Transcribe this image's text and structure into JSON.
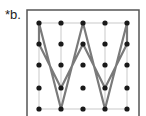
{
  "label": "*b.",
  "grid": {
    "cols_x": [
      39,
      61,
      83,
      105,
      127
    ],
    "rows_y": [
      23,
      44,
      65,
      88,
      109
    ],
    "dot_color": "#1a1a1a"
  },
  "path": {
    "color": "#7a7a7a",
    "points": [
      [
        39,
        23
      ],
      [
        61,
        109
      ],
      [
        83,
        23
      ],
      [
        105,
        109
      ],
      [
        127,
        23
      ],
      [
        127,
        44
      ],
      [
        105,
        88
      ],
      [
        83,
        44
      ],
      [
        61,
        88
      ],
      [
        39,
        44
      ],
      [
        39,
        23
      ]
    ]
  },
  "frame": {
    "x": 27,
    "y": 10,
    "w": 112,
    "h": 110,
    "color": "#555555"
  }
}
